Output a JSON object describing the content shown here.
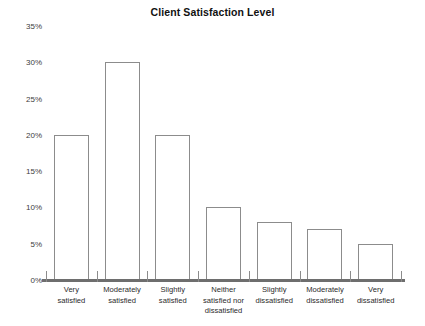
{
  "chart_data": {
    "type": "bar",
    "title": "Client Satisfaction Level",
    "xlabel": "",
    "ylabel": "",
    "categories": [
      "Very satisfied",
      "Moderately satisfied",
      "Slightly satisfied",
      "Neither satisfied nor dissatisfied",
      "Slightly dissatisfied",
      "Moderately dissatisfied",
      "Very dissatisfied"
    ],
    "values": [
      20,
      30,
      20,
      10,
      8,
      7,
      5
    ],
    "ylim": [
      0,
      35
    ],
    "ytick_labels": [
      "0%",
      "5%",
      "10%",
      "15%",
      "20%",
      "25%",
      "30%",
      "35%"
    ],
    "ytick_values": [
      0,
      5,
      10,
      15,
      20,
      25,
      30,
      35
    ],
    "grid": false,
    "legend": false,
    "bar_fill_color": "#ffffff",
    "bar_border_color": "#8c8c8c",
    "axis_color": "#6e6e6e",
    "text_color": "#1a1a1a"
  }
}
